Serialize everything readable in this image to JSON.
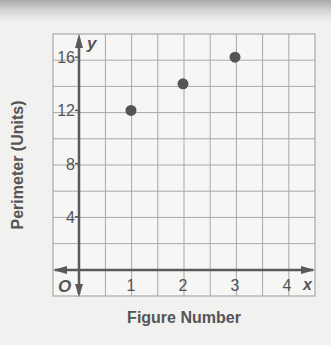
{
  "chart_data": {
    "type": "scatter",
    "title": "",
    "xlabel": "Figure Number",
    "ylabel": "Perimeter (Units)",
    "x_axis_symbol": "x",
    "y_axis_symbol": "y",
    "origin_label": "O",
    "xlim": [
      -0.5,
      4.5
    ],
    "ylim": [
      -2,
      18
    ],
    "x_ticks": [
      1,
      2,
      3,
      4
    ],
    "x_tick_labels": [
      "1",
      "2",
      "3",
      "4"
    ],
    "y_ticks": [
      4,
      8,
      12,
      16
    ],
    "y_tick_labels": [
      "4",
      "8",
      "12",
      "16"
    ],
    "grid": true,
    "grid_step_x": 0.5,
    "grid_step_y": 2,
    "legend": null,
    "series": [
      {
        "name": "Perimeter",
        "x": [
          1,
          2,
          3
        ],
        "y": [
          12,
          14,
          16
        ],
        "color": "#555555"
      }
    ]
  },
  "colors": {
    "background": "#f1f1f0",
    "grid": "#a8a8a8",
    "axis": "#5a5a5a",
    "text": "#555555",
    "point": "#555555"
  }
}
